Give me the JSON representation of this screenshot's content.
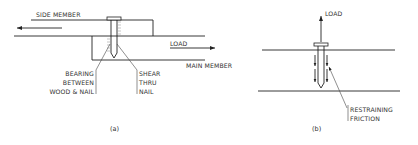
{
  "figure_a": {
    "side_member_label": "SIDE MEMBER",
    "load_label": "LOAD",
    "main_member_label": "MAIN MEMBER",
    "bearing_label": [
      "BEARING",
      "BETWEEN",
      "WOOD & NAIL"
    ],
    "shear_label": [
      "SHEAR",
      "THRU",
      "NAIL"
    ],
    "caption": "(a)"
  },
  "figure_b": {
    "load_label": "LOAD",
    "friction_label": [
      "RESTRAINING",
      "FRICTION"
    ],
    "caption": "(b)"
  }
}
